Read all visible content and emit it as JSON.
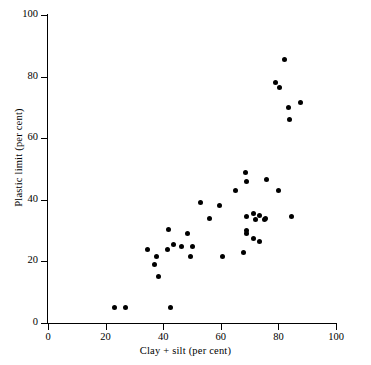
{
  "chart_data": {
    "type": "scatter",
    "title": "",
    "xlabel": "Clay + silt (per cent)",
    "ylabel": "Plastic limit (per cent)",
    "xlim": [
      0,
      100
    ],
    "ylim": [
      0,
      100
    ],
    "xticks": [
      0,
      20,
      40,
      60,
      80,
      100
    ],
    "yticks": [
      0,
      20,
      40,
      60,
      80,
      100
    ],
    "xtick_labels": [
      "0",
      "20",
      "40",
      "60",
      "80",
      "100"
    ],
    "ytick_labels": [
      "0",
      "20",
      "40",
      "60",
      "80",
      "100"
    ],
    "grid": false,
    "legend": null,
    "marker": "filled-circle",
    "marker_color": "#000000",
    "points": [
      {
        "x": 23.0,
        "y": 5.0
      },
      {
        "x": 27.0,
        "y": 5.0
      },
      {
        "x": 42.5,
        "y": 5.0
      },
      {
        "x": 34.5,
        "y": 24.0
      },
      {
        "x": 37.5,
        "y": 21.5
      },
      {
        "x": 37.0,
        "y": 19.0
      },
      {
        "x": 38.5,
        "y": 15.0
      },
      {
        "x": 42.0,
        "y": 30.5
      },
      {
        "x": 41.5,
        "y": 24.0
      },
      {
        "x": 43.5,
        "y": 25.5
      },
      {
        "x": 46.5,
        "y": 25.0
      },
      {
        "x": 48.5,
        "y": 29.0
      },
      {
        "x": 50.0,
        "y": 25.0
      },
      {
        "x": 49.5,
        "y": 21.5
      },
      {
        "x": 53.0,
        "y": 39.0
      },
      {
        "x": 56.0,
        "y": 34.0
      },
      {
        "x": 59.5,
        "y": 38.0
      },
      {
        "x": 60.5,
        "y": 21.5
      },
      {
        "x": 65.0,
        "y": 43.0
      },
      {
        "x": 68.5,
        "y": 49.0
      },
      {
        "x": 69.0,
        "y": 46.0
      },
      {
        "x": 68.0,
        "y": 23.0
      },
      {
        "x": 69.0,
        "y": 34.5
      },
      {
        "x": 69.0,
        "y": 30.0
      },
      {
        "x": 69.0,
        "y": 29.0
      },
      {
        "x": 71.5,
        "y": 35.5
      },
      {
        "x": 72.0,
        "y": 33.5
      },
      {
        "x": 71.5,
        "y": 27.5
      },
      {
        "x": 73.5,
        "y": 35.0
      },
      {
        "x": 73.5,
        "y": 26.5
      },
      {
        "x": 75.0,
        "y": 33.5
      },
      {
        "x": 75.5,
        "y": 34.0
      },
      {
        "x": 76.0,
        "y": 46.5
      },
      {
        "x": 80.0,
        "y": 43.0
      },
      {
        "x": 79.0,
        "y": 78.0
      },
      {
        "x": 80.5,
        "y": 76.5
      },
      {
        "x": 82.0,
        "y": 85.5
      },
      {
        "x": 83.5,
        "y": 70.0
      },
      {
        "x": 84.0,
        "y": 66.0
      },
      {
        "x": 84.5,
        "y": 34.5
      },
      {
        "x": 87.5,
        "y": 71.5
      }
    ]
  }
}
